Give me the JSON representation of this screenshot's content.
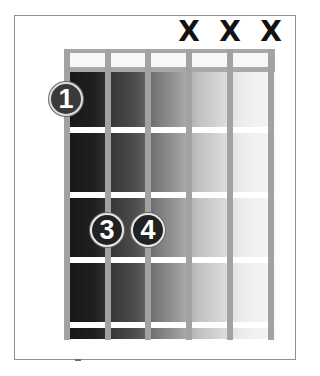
{
  "diagram": {
    "type": "guitar-chord-chart",
    "strings": 6,
    "frets_shown": 4,
    "string_positions_x": [
      67,
      108,
      148,
      189,
      230,
      271
    ],
    "fret_positions_y": [
      130,
      195,
      260,
      325
    ],
    "string_markers": [
      {
        "string": 4,
        "symbol": "X",
        "meaning": "muted"
      },
      {
        "string": 5,
        "symbol": "X",
        "meaning": "muted"
      },
      {
        "string": 6,
        "symbol": "X",
        "meaning": "muted"
      }
    ],
    "fingerings": [
      {
        "finger": "1",
        "string": 1,
        "fret": 1
      },
      {
        "finger": "3",
        "string": 2,
        "fret": 3
      },
      {
        "finger": "4",
        "string": 3,
        "fret": 3
      }
    ],
    "colors": {
      "string": "#a2a2a2",
      "fret": "#ffffff",
      "nut_border": "#a8a8a8",
      "dot_fill": "#222222",
      "dot_text": "#ffffff",
      "mute_marker": "#111111",
      "gradient_dark": "#161616",
      "gradient_light": "#f6f6f6"
    }
  }
}
